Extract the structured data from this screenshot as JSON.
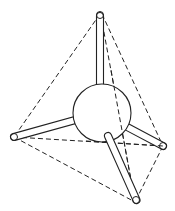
{
  "diagram": {
    "type": "tetrahedral-molecule",
    "colors": {
      "line": "#222222",
      "background": "#ffffff"
    },
    "center_atom": {
      "cx": 102,
      "cy": 113,
      "r": 29
    },
    "vertices": [
      {
        "name": "top",
        "x": 100,
        "y": 14
      },
      {
        "name": "left",
        "x": 14,
        "y": 137
      },
      {
        "name": "right",
        "x": 163,
        "y": 146
      },
      {
        "name": "bottom",
        "x": 135,
        "y": 202
      }
    ],
    "edges_dashed": [
      [
        "top",
        "left"
      ],
      [
        "top",
        "right"
      ],
      [
        "top",
        "bottom"
      ],
      [
        "left",
        "right"
      ],
      [
        "left",
        "bottom"
      ],
      [
        "right",
        "bottom"
      ]
    ]
  }
}
